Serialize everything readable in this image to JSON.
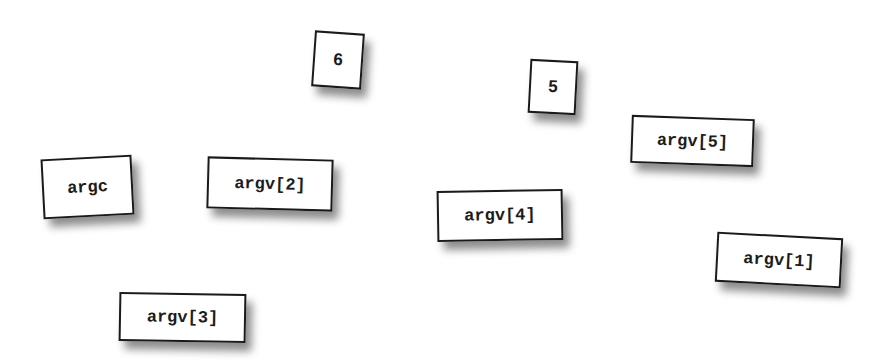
{
  "diagram": {
    "title": "",
    "background": "#ffffff",
    "card_border_color": "#1a1a1a",
    "cards": [
      {
        "id": "six",
        "label": "6",
        "x": 313,
        "y": 32,
        "w": 50,
        "h": 56,
        "rotate": 4
      },
      {
        "id": "five",
        "label": "5",
        "x": 529,
        "y": 60,
        "w": 48,
        "h": 54,
        "rotate": 3
      },
      {
        "id": "argv5",
        "label": "argv[5]",
        "x": 631,
        "y": 117,
        "w": 123,
        "h": 48,
        "rotate": 2
      },
      {
        "id": "argc",
        "label": "argc",
        "x": 42,
        "y": 157,
        "w": 91,
        "h": 60,
        "rotate": -3
      },
      {
        "id": "argv2",
        "label": "argv[2]",
        "x": 207,
        "y": 158,
        "w": 126,
        "h": 52,
        "rotate": 1.5
      },
      {
        "id": "argv4",
        "label": "argv[4]",
        "x": 437,
        "y": 190,
        "w": 126,
        "h": 51,
        "rotate": -1
      },
      {
        "id": "argv1",
        "label": "argv[1]",
        "x": 716,
        "y": 235,
        "w": 126,
        "h": 50,
        "rotate": 3
      },
      {
        "id": "argv3",
        "label": "argv[3]",
        "x": 119,
        "y": 293,
        "w": 127,
        "h": 49,
        "rotate": 1
      }
    ]
  }
}
